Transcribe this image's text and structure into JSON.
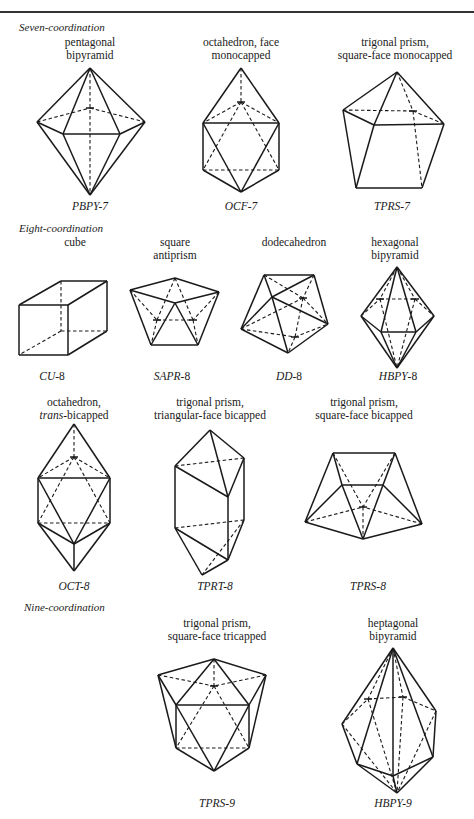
{
  "sections": {
    "seven": "Seven-coordination",
    "eight": "Eight-coordination",
    "nine": "Nine-coordination"
  },
  "polyhedra": [
    {
      "id": "PBPY-7",
      "name_line1": "pentagonal",
      "name_line2": "bipyramid",
      "code_italic": "PBPY",
      "code_suffix": "-7"
    },
    {
      "id": "OCF-7",
      "name_line1": "octahedron, face",
      "name_line2": "monocapped",
      "code_italic": "OCF",
      "code_suffix": "-7"
    },
    {
      "id": "TPRS-7",
      "name_line1": "trigonal prism,",
      "name_line2": "square-face monocapped",
      "code_italic": "TPRS",
      "code_suffix": "-7"
    },
    {
      "id": "CU-8",
      "name_line1": "cube",
      "name_line2": "",
      "code_italic": "CU",
      "code_suffix": "-8"
    },
    {
      "id": "SAPR-8",
      "name_line1": "square",
      "name_line2": "antiprism",
      "code_italic": "SAPR",
      "code_suffix": "-8"
    },
    {
      "id": "DD-8",
      "name_line1": "dodecahedron",
      "name_line2": "",
      "code_italic": "DD",
      "code_suffix": "-8"
    },
    {
      "id": "HBPY-8",
      "name_line1": "hexagonal",
      "name_line2": "bipyramid",
      "code_italic": "HBPY",
      "code_suffix": "-8"
    },
    {
      "id": "OCT-8",
      "name_line1": "octahedron,",
      "name_line2_italic": "trans",
      "name_line2": "-bicapped",
      "code_italic": "OCT",
      "code_suffix": "-8"
    },
    {
      "id": "TPRT-8",
      "name_line1": "trigonal prism,",
      "name_line2": "triangular-face bicapped",
      "code_italic": "TPRT",
      "code_suffix": "-8"
    },
    {
      "id": "TPRS-8",
      "name_line1": "trigonal prism,",
      "name_line2": "square-face bicapped",
      "code_italic": "TPRS",
      "code_suffix": "-8"
    },
    {
      "id": "TPRS-9",
      "name_line1": "trigonal prism,",
      "name_line2": "square-face tricapped",
      "code_italic": "TPRS",
      "code_suffix": "-9"
    },
    {
      "id": "HBPY-9",
      "name_line1": "heptagonal",
      "name_line2": "bipyramid",
      "code_italic": "HBPY",
      "code_suffix": "-9"
    }
  ]
}
